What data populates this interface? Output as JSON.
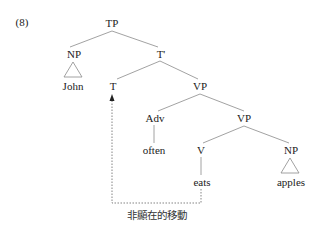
{
  "example_number": "(8)",
  "tree": {
    "nodes": {
      "tp": "TP",
      "np_subject": "NP",
      "t_bar": "T'",
      "t": "T",
      "vp_upper": "VP",
      "adv": "Adv",
      "vp_lower": "VP",
      "v": "V",
      "np_object": "NP"
    },
    "leaves": {
      "john": "John",
      "often": "often",
      "eats": "eats",
      "apples": "apples"
    }
  },
  "movement": {
    "type": "dotted-arrow",
    "from": "eats",
    "to": "T",
    "label": "非顯在的移動"
  },
  "colors": {
    "line": "#888888",
    "text": "#222222"
  }
}
